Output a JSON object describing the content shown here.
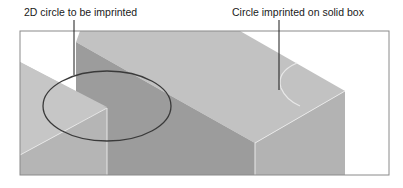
{
  "labels": {
    "left": "2D circle to be imprinted",
    "right": "Circle imprinted on solid box"
  },
  "colors": {
    "background": "#ffffff",
    "frame": "#8a8a8a",
    "left_block_top": "#c4c4c4",
    "left_block_front": "#b4b4b4",
    "big_block_top": "#c2c2c2",
    "big_block_left_face": "#9a9a9a",
    "big_block_front": "#b2b2b2",
    "edge_highlight": "#e6e6e6",
    "circle": "#3a3a3a",
    "leader": "#1a1a1a"
  }
}
